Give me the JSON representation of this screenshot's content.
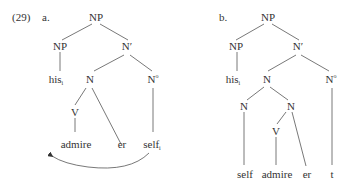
{
  "example_number": "(29)",
  "trees": [
    {
      "label": "a.",
      "nodes": {
        "root": "NP",
        "np": "NP",
        "nbar": "N′",
        "his": "his",
        "his_sub": "i",
        "n": "N",
        "n0": "N",
        "n0_sup": "o",
        "v": "V",
        "admire": "admire",
        "er": "er",
        "self": "self",
        "self_sub": "i"
      },
      "movement_arrow": {
        "from": "self",
        "to": "left of admire"
      }
    },
    {
      "label": "b.",
      "nodes": {
        "root": "NP",
        "np": "NP",
        "nbar": "N′",
        "his": "his",
        "his_sub": "i",
        "n": "N",
        "n0": "N",
        "n0_sup": "o",
        "n_left": "N",
        "n_right": "N",
        "v": "V",
        "self": "self",
        "admire": "admire",
        "er": "er",
        "trace": "t"
      }
    }
  ]
}
